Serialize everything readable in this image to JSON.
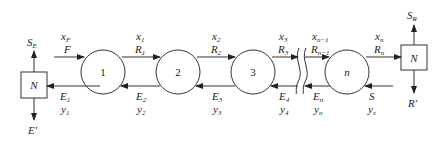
{
  "diagram": {
    "type": "countercurrent multistage extraction cascade",
    "left_mixer": {
      "label": "N",
      "top_output": {
        "main": "S",
        "sub": "E"
      },
      "bottom_output": "E′"
    },
    "right_mixer": {
      "label": "N",
      "top_output": {
        "main": "S",
        "sub": "R"
      },
      "bottom_output": "R′"
    },
    "stages": [
      {
        "label": "1"
      },
      {
        "label": "2"
      },
      {
        "label": "3"
      },
      {
        "label": "n"
      }
    ],
    "feed": {
      "line1": {
        "main": "x",
        "sub": "F"
      },
      "line2": "F"
    },
    "raffinate_streams": [
      {
        "x": {
          "main": "x",
          "sub": "1"
        },
        "R": {
          "main": "R",
          "sub": "1"
        }
      },
      {
        "x": {
          "main": "x",
          "sub": "2"
        },
        "R": {
          "main": "R",
          "sub": "2"
        }
      },
      {
        "x": {
          "main": "x",
          "sub": "3"
        },
        "R": {
          "main": "R",
          "sub": "3"
        }
      },
      {
        "x": {
          "main": "x",
          "sub": "n−1"
        },
        "R": {
          "main": "R",
          "sub": "n−1"
        }
      },
      {
        "x": {
          "main": "x",
          "sub": "n"
        },
        "R": {
          "main": "R",
          "sub": "n"
        }
      }
    ],
    "extract_streams": [
      {
        "E": {
          "main": "E",
          "sub": "1"
        },
        "y": {
          "main": "y",
          "sub": "1"
        }
      },
      {
        "E": {
          "main": "E",
          "sub": "2"
        },
        "y": {
          "main": "y",
          "sub": "2"
        }
      },
      {
        "E": {
          "main": "E",
          "sub": "3"
        },
        "y": {
          "main": "y",
          "sub": "3"
        }
      },
      {
        "E": {
          "main": "E",
          "sub": "4"
        },
        "y": {
          "main": "y",
          "sub": "4"
        }
      },
      {
        "E": {
          "main": "E",
          "sub": "n"
        },
        "y": {
          "main": "y",
          "sub": "n"
        }
      }
    ],
    "solvent": {
      "line1": "S",
      "line2": {
        "main": "y",
        "sub": "s"
      }
    }
  }
}
